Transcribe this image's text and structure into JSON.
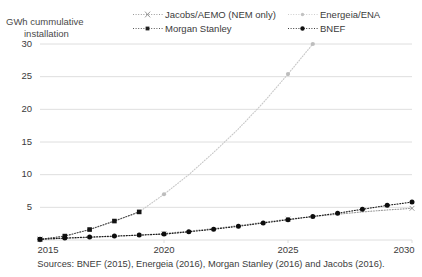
{
  "axis_title": {
    "line1": "GWh cummulative",
    "line2": "installation"
  },
  "legend": {
    "entries": [
      {
        "label": "Jacobs/AEMO (NEM only)",
        "key": "dotted-cross-key",
        "color": "#9a9a9a",
        "marker": "cross"
      },
      {
        "label": "Energeia/ENA",
        "key": "dotted-light-key",
        "color": "#c8c8c8",
        "marker": "dot"
      },
      {
        "label": "Morgan Stanley",
        "key": "dotted-square-key",
        "color": "#4d4d4d",
        "marker": "square"
      },
      {
        "label": "BNEF",
        "key": "dotted-circle-key",
        "color": "#1a1a1a",
        "marker": "circle"
      }
    ]
  },
  "source_note": "Sources: BNEF (2015), Energeia (2016), Morgan Stanley (2016) and Jacobs (2016).",
  "chart_data": {
    "type": "line",
    "title": "",
    "subtitle": "",
    "xlabel": "",
    "ylabel": "GWh cummulative installation",
    "xlim": [
      2015,
      2030
    ],
    "ylim": [
      0,
      30
    ],
    "yticks": [
      30,
      25,
      20,
      15,
      10,
      5
    ],
    "xticks": [
      2015,
      2020,
      2025,
      2030
    ],
    "grid": "horizontal",
    "legend_position": "top",
    "series": [
      {
        "name": "Jacobs/AEMO (NEM only)",
        "color": "#9a9a9a",
        "marker": "cross",
        "style": "dotted",
        "x": [
          2015,
          2016,
          2017,
          2018,
          2019,
          2020,
          2021,
          2022,
          2023,
          2024,
          2025,
          2026,
          2027,
          2028,
          2029,
          2030
        ],
        "y": [
          0.15,
          0.25,
          0.4,
          0.55,
          0.75,
          1.0,
          1.35,
          1.75,
          2.2,
          2.7,
          3.2,
          3.6,
          3.95,
          4.3,
          4.6,
          4.85
        ]
      },
      {
        "name": "Energeia/ENA",
        "color": "#c8c8c8",
        "marker": "dot",
        "style": "dotted",
        "x": [
          2015,
          2016,
          2017,
          2018,
          2019,
          2020,
          2021,
          2022,
          2023,
          2024,
          2025,
          2026
        ],
        "y": [
          0.1,
          0.6,
          1.6,
          2.9,
          4.3,
          7.0,
          10.0,
          13.4,
          17.0,
          21.0,
          25.4,
          30.0
        ]
      },
      {
        "name": "Morgan Stanley",
        "color": "#4d4d4d",
        "marker": "square",
        "style": "dotted",
        "x": [
          2015,
          2016,
          2017,
          2018,
          2019
        ],
        "y": [
          0.1,
          0.6,
          1.6,
          2.9,
          4.3
        ]
      },
      {
        "name": "BNEF",
        "color": "#1a1a1a",
        "marker": "circle",
        "style": "dotted",
        "x": [
          2015,
          2016,
          2017,
          2018,
          2019,
          2020,
          2021,
          2022,
          2023,
          2024,
          2025,
          2026,
          2027,
          2028,
          2029,
          2030
        ],
        "y": [
          0.1,
          0.3,
          0.45,
          0.6,
          0.75,
          0.9,
          1.25,
          1.65,
          2.1,
          2.6,
          3.1,
          3.6,
          4.1,
          4.7,
          5.3,
          5.8
        ]
      }
    ]
  }
}
